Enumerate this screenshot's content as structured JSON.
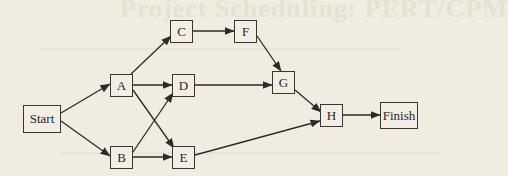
{
  "background_text": "Project Scheduling: PERT/CPM",
  "colors": {
    "background": "#f1ece0",
    "stroke": "#2e2a27",
    "node_fill": "#f3eee3"
  },
  "nodes": [
    {
      "id": "start",
      "label": "Start",
      "x": 23,
      "y": 105,
      "w": 38,
      "h": 28
    },
    {
      "id": "a",
      "label": "A",
      "x": 110,
      "y": 74,
      "w": 23,
      "h": 23
    },
    {
      "id": "b",
      "label": "B",
      "x": 110,
      "y": 146,
      "w": 23,
      "h": 23
    },
    {
      "id": "c",
      "label": "C",
      "x": 170,
      "y": 20,
      "w": 23,
      "h": 23
    },
    {
      "id": "d",
      "label": "D",
      "x": 172,
      "y": 74,
      "w": 23,
      "h": 23
    },
    {
      "id": "e",
      "label": "E",
      "x": 172,
      "y": 146,
      "w": 23,
      "h": 23
    },
    {
      "id": "f",
      "label": "F",
      "x": 234,
      "y": 20,
      "w": 23,
      "h": 23
    },
    {
      "id": "g",
      "label": "G",
      "x": 272,
      "y": 71,
      "w": 23,
      "h": 23
    },
    {
      "id": "h",
      "label": "H",
      "x": 320,
      "y": 104,
      "w": 23,
      "h": 23
    },
    {
      "id": "finish",
      "label": "Finish",
      "x": 380,
      "y": 102,
      "w": 38,
      "h": 27
    }
  ],
  "edges": [
    {
      "from": "start",
      "to": "a",
      "x1": 61,
      "y1": 113,
      "x2": 110,
      "y2": 84
    },
    {
      "from": "start",
      "to": "b",
      "x1": 61,
      "y1": 121,
      "x2": 110,
      "y2": 156
    },
    {
      "from": "a",
      "to": "c",
      "x1": 131,
      "y1": 74,
      "x2": 171,
      "y2": 36
    },
    {
      "from": "a",
      "to": "d",
      "x1": 133,
      "y1": 85,
      "x2": 172,
      "y2": 85
    },
    {
      "from": "a",
      "to": "e",
      "x1": 133,
      "y1": 90,
      "x2": 174,
      "y2": 148
    },
    {
      "from": "b",
      "to": "d",
      "x1": 133,
      "y1": 152,
      "x2": 173,
      "y2": 93
    },
    {
      "from": "b",
      "to": "e",
      "x1": 133,
      "y1": 157,
      "x2": 172,
      "y2": 157
    },
    {
      "from": "c",
      "to": "f",
      "x1": 193,
      "y1": 31,
      "x2": 234,
      "y2": 31
    },
    {
      "from": "f",
      "to": "g",
      "x1": 257,
      "y1": 36,
      "x2": 281,
      "y2": 71
    },
    {
      "from": "d",
      "to": "g",
      "x1": 195,
      "y1": 85,
      "x2": 272,
      "y2": 85
    },
    {
      "from": "g",
      "to": "h",
      "x1": 295,
      "y1": 90,
      "x2": 321,
      "y2": 112
    },
    {
      "from": "e",
      "to": "h",
      "x1": 195,
      "y1": 155,
      "x2": 320,
      "y2": 121
    },
    {
      "from": "h",
      "to": "finish",
      "x1": 343,
      "y1": 115,
      "x2": 380,
      "y2": 115
    }
  ]
}
